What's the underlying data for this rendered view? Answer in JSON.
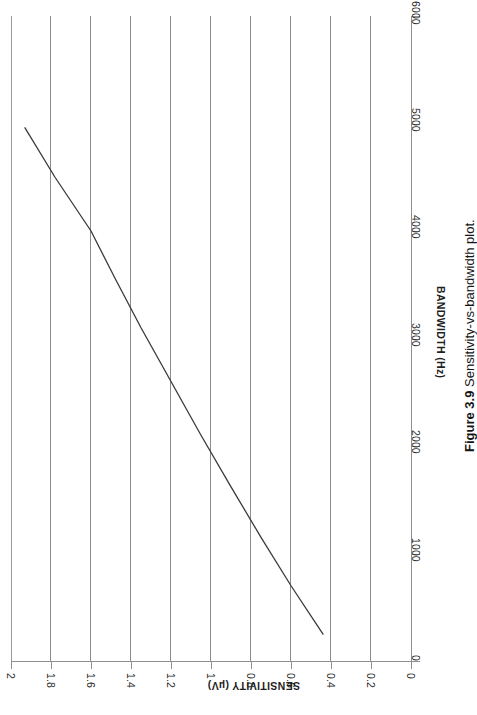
{
  "figure": {
    "caption_label": "Figure 3.9",
    "caption_text": "Sensitivity-vs-bandwidth plot.",
    "page_rotation_deg": 90
  },
  "chart_data": {
    "type": "line",
    "title": "",
    "xlabel": "BANDWIDTH (Hz)",
    "ylabel": "SENSITIVITY (µV)",
    "xlim": [
      0,
      6000
    ],
    "ylim": [
      0,
      2
    ],
    "xticks": [
      0,
      1000,
      2000,
      3000,
      4000,
      5000,
      6000
    ],
    "xtick_labels": [
      "0",
      "1000",
      "2000",
      "3000",
      "4000",
      "5000",
      "6000"
    ],
    "yticks": [
      0,
      0.2,
      0.4,
      0.6,
      0.8,
      1,
      1.2,
      1.4,
      1.6,
      1.8,
      2
    ],
    "ytick_labels": [
      "0",
      "0.2",
      "0.4",
      "0.6",
      "0.8",
      "1",
      "1.2",
      "1.4",
      "1.6",
      "1.8",
      "2"
    ],
    "grid": "y-gridlines only",
    "legend": "none",
    "line_color": "#3a3a3a",
    "series": [
      {
        "name": "sensitivity vs bandwidth",
        "x": [
          250,
          700,
          1150,
          1620,
          2100,
          2600,
          3100,
          3560,
          4000,
          4500,
          4960
        ],
        "y": [
          0.44,
          0.6,
          0.75,
          0.9,
          1.05,
          1.2,
          1.35,
          1.48,
          1.6,
          1.78,
          1.93
        ]
      }
    ]
  }
}
